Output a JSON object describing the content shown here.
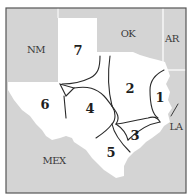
{
  "map": {
    "title": "Texas regions map",
    "colors": {
      "outside": "#d4d4d4",
      "texas": "#ffffff",
      "boundary": "#2a2a2a",
      "frame": "#555555"
    },
    "states": [
      {
        "id": "nm",
        "label": "NM",
        "x": 36,
        "y": 50
      },
      {
        "id": "ok",
        "label": "OK",
        "x": 128,
        "y": 34
      },
      {
        "id": "ar",
        "label": "AR",
        "x": 172,
        "y": 39
      },
      {
        "id": "la",
        "label": "LA",
        "x": 176,
        "y": 127
      },
      {
        "id": "mex",
        "label": "MEX",
        "x": 54,
        "y": 161
      }
    ],
    "regions": [
      {
        "id": "r1",
        "label": "1",
        "x": 160,
        "y": 97
      },
      {
        "id": "r2",
        "label": "2",
        "x": 130,
        "y": 88
      },
      {
        "id": "r3",
        "label": "3",
        "x": 135,
        "y": 135
      },
      {
        "id": "r4",
        "label": "4",
        "x": 90,
        "y": 108
      },
      {
        "id": "r5",
        "label": "5",
        "x": 111,
        "y": 152
      },
      {
        "id": "r6",
        "label": "6",
        "x": 45,
        "y": 104
      },
      {
        "id": "r7",
        "label": "7",
        "x": 78,
        "y": 50
      }
    ]
  }
}
